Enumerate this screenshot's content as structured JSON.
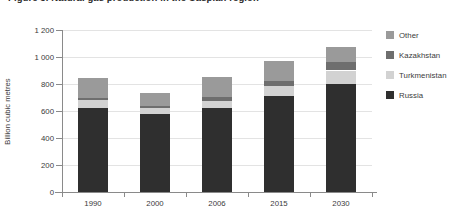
{
  "title": {
    "text": "Figure 3. Natural gas production in the Caspian region"
  },
  "chart_data": {
    "type": "bar",
    "subtype": "stacked-bar",
    "title": "Figure 3. Natural gas production in the Caspian region",
    "xlabel": "",
    "ylabel": "Billion cubic metres",
    "categories": [
      "1990",
      "2000",
      "2006",
      "2015",
      "2030"
    ],
    "ylim": [
      0,
      1200
    ],
    "yticks": [
      0,
      200,
      400,
      600,
      800,
      1000,
      1200
    ],
    "ytick_labels": [
      "0",
      "200",
      "400",
      "600",
      "800",
      "1 000",
      "1 200"
    ],
    "grid": true,
    "legend_position": "right",
    "series": [
      {
        "name": "Russia",
        "color": "#2f2f2f",
        "values": [
          620,
          580,
          620,
          710,
          800
        ]
      },
      {
        "name": "Turkmenistan",
        "color": "#d2d2d2",
        "values": [
          60,
          45,
          55,
          75,
          100
        ]
      },
      {
        "name": "Kazakhstan",
        "color": "#6e6e6e",
        "values": [
          15,
          15,
          30,
          40,
          60
        ]
      },
      {
        "name": "Other",
        "color": "#9a9a9a",
        "values": [
          150,
          90,
          145,
          145,
          115
        ]
      }
    ],
    "totals": [
      845,
      730,
      850,
      970,
      1075
    ]
  },
  "legend": {
    "items": [
      {
        "label": "Other",
        "color": "#9a9a9a"
      },
      {
        "label": "Kazakhstan",
        "color": "#6e6e6e"
      },
      {
        "label": "Turkmenistan",
        "color": "#d2d2d2"
      },
      {
        "label": "Russia",
        "color": "#2f2f2f"
      }
    ]
  },
  "colors": {
    "axis": "#8a8a8a",
    "grid": "#e3e3e3",
    "text": "#3b3b3b",
    "background": "#ffffff"
  }
}
